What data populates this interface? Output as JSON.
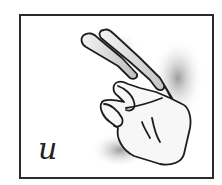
{
  "card": {
    "letter": "u",
    "illustration": "hand-sign-u-icon"
  },
  "colors": {
    "border": "#2a2a2a",
    "outline": "#1e1e1e",
    "shade": "#9a9a9a",
    "background": "#ffffff"
  }
}
